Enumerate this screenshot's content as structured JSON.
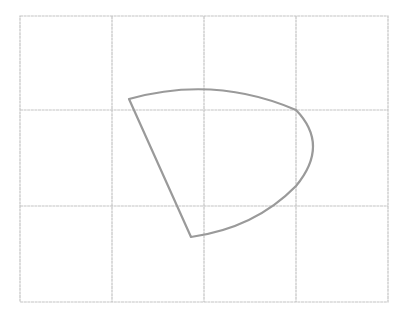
{
  "diagram": {
    "grid": {
      "left": 20,
      "top": 16,
      "right": 388,
      "bottom": 302,
      "columns": 4,
      "rows": 3,
      "vertical_lines": [
        112,
        204,
        296
      ],
      "horizontal_lines": [
        110,
        206
      ],
      "color": "#c4c4c4"
    },
    "shape": {
      "type": "sector",
      "color": "#9a9a9a",
      "path": "M129,99 Q215,75 296,110 Q330,145 296,186 Q255,228 191,237 Z",
      "vertices": [
        [
          129,
          99
        ],
        [
          191,
          237
        ]
      ],
      "arc_extent": {
        "top": 86,
        "rightmost_x": 316
      }
    }
  }
}
